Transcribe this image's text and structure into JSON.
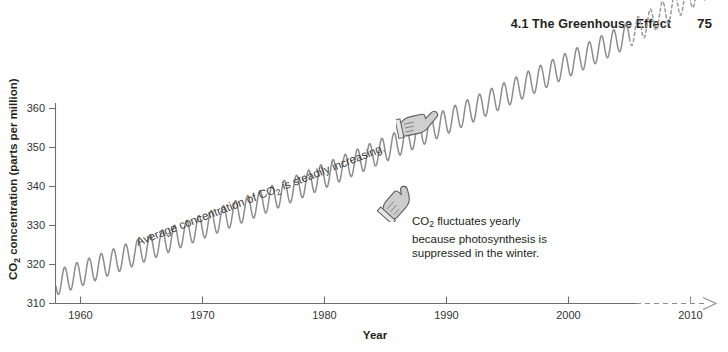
{
  "header": {
    "title": "4.1 The Greenhouse Effect",
    "page_number": "75"
  },
  "chart_data": {
    "type": "line",
    "title": "",
    "xlabel": "Year",
    "ylabel": "CO2 concentration (parts per million)",
    "ylabel_parts": {
      "prefix": "CO",
      "sub": "2",
      "suffix": " concentration (parts per million)"
    },
    "xlim": [
      1957,
      2012
    ],
    "ylim": [
      310,
      363
    ],
    "xticks": [
      "1960",
      "1970",
      "1980",
      "1990",
      "2000",
      "2010"
    ],
    "xtick_values": [
      1960,
      1970,
      1980,
      1990,
      2000,
      2010
    ],
    "yticks": [
      "310",
      "320",
      "330",
      "340",
      "350",
      "360"
    ],
    "ytick_values": [
      310,
      320,
      330,
      340,
      350,
      360
    ],
    "grid": false,
    "legend": "none",
    "line_color": "#8c8c8c",
    "axis_color": "#6e6e6e",
    "series": [
      {
        "name": "Observed CO2 (monthly, Mauna Loa)",
        "style": "solid",
        "x_start": 1958.0,
        "x_end": 2005.0,
        "trend_start": 315.3,
        "trend_end": 379.0,
        "trend_curvature": 9.5,
        "seasonal_amplitude": 3.2,
        "cycles_per_year": 1
      },
      {
        "name": "Projected CO2 (dashed extension)",
        "style": "dashed",
        "x_start": 2005.0,
        "x_end": 2011.2,
        "trend_start": 379.0,
        "trend_end": 391.0,
        "seasonal_amplitude": 3.2,
        "cycles_per_year": 1
      }
    ],
    "x_axis_extension": {
      "style": "dashed",
      "from": 2005.0,
      "to": 2011.5,
      "arrow": true
    },
    "annotations": [
      {
        "id": "trend-annotation",
        "text": "Average concentration of CO2 is steadily increasing.",
        "text_prefix": "Average concentration of CO",
        "text_sub": "2",
        "text_suffix": " is steadily increasing.",
        "rotation_deg": -21,
        "icon": "pointing-hand-right"
      },
      {
        "id": "seasonal-annotation",
        "lines": [
          "CO2 fluctuates yearly",
          "because photosynthesis is",
          "suppressed in the winter."
        ],
        "line1_prefix": "CO",
        "line1_sub": "2",
        "line1_suffix": " fluctuates yearly",
        "line2": "because photosynthesis is",
        "line3": "suppressed in the winter.",
        "icon": "pointing-hand-up-left"
      }
    ]
  },
  "icons": {
    "hand_right": "pointing-hand-right-icon",
    "hand_up_left": "pointing-hand-up-left-icon"
  }
}
